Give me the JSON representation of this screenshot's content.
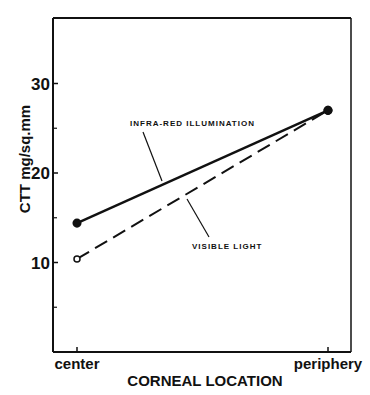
{
  "chart_data": {
    "type": "line",
    "title": "",
    "xlabel": "CORNEAL LOCATION",
    "ylabel": "CTT mg/sq.mm",
    "categories": [
      "center",
      "periphery"
    ],
    "ylim": [
      0,
      37
    ],
    "yticks_major": [
      10,
      20,
      30
    ],
    "yticks_minor": [
      5,
      15,
      25
    ],
    "grid": false,
    "legend": "none (inline annotations)",
    "series": [
      {
        "name": "INFRA-RED ILLUMINATION",
        "values": [
          14.4,
          27
        ],
        "line_style": "solid",
        "marker": "filled-circle",
        "color": "#111111"
      },
      {
        "name": "VISIBLE LIGHT",
        "values": [
          10.4,
          27
        ],
        "line_style": "dashed",
        "marker": "open-circle",
        "color": "#111111"
      }
    ],
    "annotations": [
      {
        "text": "INFRA-RED ILLUMINATION",
        "series": 0
      },
      {
        "text": "VISIBLE LIGHT",
        "series": 1
      }
    ]
  }
}
